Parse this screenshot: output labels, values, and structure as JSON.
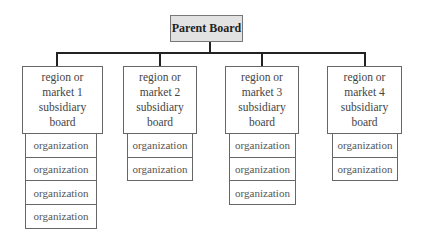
{
  "diagram": {
    "type": "org-chart",
    "parent": {
      "label": "Parent Board"
    },
    "subsidiaries": [
      {
        "label": "region or market 1 subsidiary board",
        "organizations": [
          "organization",
          "organization",
          "organization",
          "organization"
        ]
      },
      {
        "label": "region or market 2 subsidiary board",
        "organizations": [
          "organization",
          "organization"
        ]
      },
      {
        "label": "region or market 3 subsidiary board",
        "organizations": [
          "organization",
          "organization",
          "organization"
        ]
      },
      {
        "label": "region or market 4 subsidiary board",
        "organizations": [
          "organization",
          "organization"
        ]
      }
    ],
    "colors": {
      "parent_fill": "#e2e2e2",
      "border": "#666666",
      "connector": "#222222"
    }
  }
}
